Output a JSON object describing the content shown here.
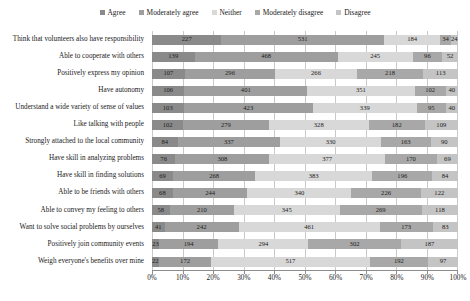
{
  "chart_data": {
    "type": "bar",
    "subtype": "stacked-horizontal-100-percent",
    "title": "",
    "xlabel": "",
    "ylabel": "",
    "xlim": [
      0,
      100
    ],
    "xtick_labels": [
      "0%",
      "10%",
      "20%",
      "30%",
      "40%",
      "50%",
      "60%",
      "70%",
      "80%",
      "90%",
      "100%"
    ],
    "grid": true,
    "legend_position": "top-center",
    "value_labels": true,
    "categories": [
      "Think that volunteers also have responsibility",
      "Able to cooperate with others",
      "Positively express my opinion",
      "Have autonomy",
      "Understand a wide variety of sense of values",
      "Like talking with people",
      "Strongly attached to the local community",
      "Have skill in analyzing problems",
      "Have skill in finding solutions",
      "Able to be friends with others",
      "Able to convey my feeling to others",
      "Want to solve social problems by ourselves",
      "Positively join community events",
      "Weigh everyone's benefits over mine"
    ],
    "series": [
      {
        "name": "Agree",
        "color": "#8a8a8a",
        "values": [
          227,
          139,
          107,
          106,
          103,
          102,
          84,
          76,
          69,
          68,
          58,
          41,
          23,
          22
        ]
      },
      {
        "name": "Moderately agree",
        "color": "#9e9e9e",
        "values": [
          531,
          468,
          296,
          401,
          423,
          279,
          337,
          308,
          268,
          244,
          210,
          242,
          194,
          172
        ]
      },
      {
        "name": "Neither",
        "color": "#d8d8d8",
        "values": [
          184,
          245,
          266,
          351,
          339,
          328,
          330,
          377,
          383,
          340,
          345,
          461,
          294,
          517
        ]
      },
      {
        "name": "Moderately disagree",
        "color": "#a8a8a8",
        "values": [
          34,
          96,
          218,
          102,
          95,
          182,
          163,
          170,
          196,
          226,
          269,
          173,
          302,
          192
        ]
      },
      {
        "name": "Disagree",
        "color": "#c4c4c4",
        "values": [
          24,
          52,
          113,
          40,
          40,
          109,
          90,
          69,
          84,
          122,
          118,
          83,
          187,
          97
        ]
      }
    ]
  }
}
